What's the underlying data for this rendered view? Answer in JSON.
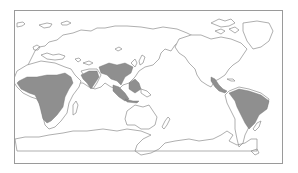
{
  "map": {
    "projection": "Pacific-centered equirectangular world map",
    "frame_color": "#9a9a9a",
    "coastline_color": "#8c8c8c",
    "highlight_color": "#8f8f8f",
    "background_color": "#ffffff",
    "highlighted_regions": [
      {
        "name": "Central & Southern Africa"
      },
      {
        "name": "India"
      },
      {
        "name": "Southeast Asia"
      },
      {
        "name": "Maritime Southeast Asia"
      },
      {
        "name": "Central America"
      },
      {
        "name": "Northern & Central South America"
      }
    ],
    "labels": []
  }
}
